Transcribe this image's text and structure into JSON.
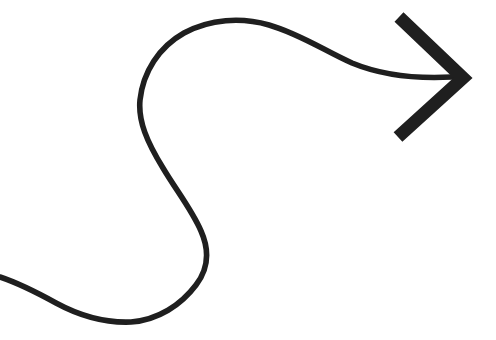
{
  "canvas": {
    "width": 496,
    "height": 340,
    "background_color": "#ffffff",
    "title": "Curved arrow pointing right"
  },
  "graphic": {
    "name": "curved-arrow",
    "stroke_color": "#1f1f1f",
    "fill": "none",
    "description": "Hand-drawn style S-curved line sweeping from lower-left, looping up and over to the right, ending in a large chevron arrowhead pointing right",
    "tail": {
      "name": "arrow-tail-path",
      "stroke_width": 5.6,
      "line_cap": "round",
      "line_join": "round",
      "path": "M 0 277 C 18 283 36 292 56 303 C 80 316 106 323 131 322 C 158 320 181 305 196 285 C 209 268 209 249 201 231 C 192 210 176 190 163 168 C 147 142 138 121 140 100 C 143 72 159 47 184 33 C 210 19 241 17 269 25 C 300 34 325 51 352 63 C 381 75 415 79 452 77",
      "key_points": [
        {
          "label": "tail-start",
          "x": 0,
          "y": 277
        },
        {
          "label": "lower-trough",
          "x": 131,
          "y": 322
        },
        {
          "label": "lower-right-bulge",
          "x": 205,
          "y": 262
        },
        {
          "label": "inflection",
          "x": 163,
          "y": 168
        },
        {
          "label": "left-extremity",
          "x": 140,
          "y": 98
        },
        {
          "label": "top-crest",
          "x": 235,
          "y": 23
        },
        {
          "label": "tail-end",
          "x": 452,
          "y": 77
        }
      ]
    },
    "arrowhead": {
      "name": "arrow-head-chevron",
      "stroke_width": 13,
      "line_cap": "butt",
      "line_join": "miter",
      "shape": "chevron",
      "path": "M 399 17 L 463 78 L 398 137",
      "key_points": [
        {
          "label": "upper-arm-tip",
          "x": 399,
          "y": 17
        },
        {
          "label": "apex",
          "x": 463,
          "y": 78
        },
        {
          "label": "lower-arm-tip",
          "x": 398,
          "y": 137
        }
      ]
    }
  }
}
